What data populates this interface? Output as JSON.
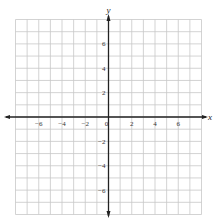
{
  "chart_data": {
    "type": "coordinate-grid",
    "title": "",
    "xlabel": "x",
    "ylabel": "y",
    "xlim": [
      -8,
      8
    ],
    "ylim": [
      -8,
      8
    ],
    "grid": true,
    "grid_step": 1,
    "x_ticks": [
      -6,
      -4,
      -2,
      0,
      2,
      4,
      6
    ],
    "y_ticks": [
      6,
      4,
      2,
      -2,
      -4,
      -6
    ],
    "x_tick_labels": [
      "-6",
      "-4",
      "-2",
      "0",
      "2",
      "4",
      "6"
    ],
    "y_tick_labels": [
      "6",
      "4",
      "2",
      "-2",
      "-4",
      "-6"
    ],
    "series": []
  },
  "colors": {
    "grid": "#c8c8c8",
    "axis": "#222222",
    "background": "#ffffff"
  },
  "labels": {
    "x_axis": "x",
    "y_axis": "y"
  }
}
